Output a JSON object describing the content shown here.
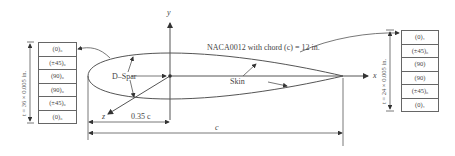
{
  "diagram": {
    "title": "NACA0012 with chord (c) = 12 in.",
    "axes": {
      "x": "x",
      "y": "y",
      "z": "z"
    },
    "labels": {
      "d_spar": "D–Spar",
      "skin": "Skin",
      "spar_position": "0.35 c",
      "chord": "c"
    },
    "left_laminate": {
      "thickness_label": "t = 36 × 0.005 in.",
      "plies": [
        "(0)₆",
        "(±45)₆",
        "(90)₆",
        "(90)₆",
        "(±45)₆",
        "(0)₆"
      ]
    },
    "right_laminate": {
      "thickness_label": "t = 24 × 0.005 in.",
      "plies": [
        "(0)₁",
        "(±45)₆",
        "(90)",
        "(90)",
        "(±45)₆",
        "(0)₁"
      ]
    },
    "colors": {
      "line": "#555555",
      "text": "#444444"
    }
  }
}
